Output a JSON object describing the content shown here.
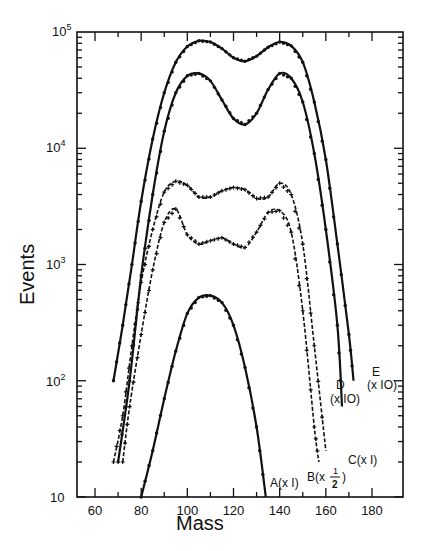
{
  "chart_data": {
    "type": "line",
    "title": "",
    "xlabel": "Mass",
    "ylabel": "Events",
    "xlim": [
      48,
      188
    ],
    "ylim": [
      10,
      100000
    ],
    "yscale": "log",
    "grid": false,
    "legend": "none (inline curve labels)",
    "x_ticks": [
      60,
      80,
      100,
      120,
      140,
      160,
      180
    ],
    "x_tick_labels": [
      "60",
      "80",
      "100",
      "120",
      "140",
      "160",
      "180"
    ],
    "y_ticks": [
      10,
      100,
      1000,
      10000,
      100000
    ],
    "y_tick_labels": [
      "10",
      "10^2",
      "10^3",
      "10^4",
      "10^5"
    ],
    "series": [
      {
        "name": "A(x1)",
        "label": "A(x I)",
        "style": "solid fit + points",
        "x": [
          80,
          85,
          90,
          95,
          100,
          105,
          110,
          115,
          120,
          125,
          130,
          134
        ],
        "values": [
          10,
          25,
          70,
          180,
          380,
          520,
          540,
          470,
          300,
          130,
          40,
          10
        ]
      },
      {
        "name": "B(x1/2)",
        "label": "B(x 1/2)",
        "style": "dashed + points",
        "x": [
          72,
          75,
          80,
          85,
          90,
          95,
          100,
          105,
          110,
          115,
          120,
          125,
          130,
          135,
          140,
          145,
          150,
          155,
          157
        ],
        "values": [
          20,
          60,
          250,
          900,
          2300,
          3000,
          1800,
          1500,
          1600,
          1700,
          1500,
          1400,
          1900,
          2800,
          2900,
          1900,
          400,
          40,
          20
        ]
      },
      {
        "name": "C(x1)",
        "label": "C(x I)",
        "style": "dashed + points",
        "x": [
          68,
          72,
          76,
          80,
          85,
          90,
          95,
          100,
          105,
          110,
          115,
          120,
          125,
          130,
          135,
          140,
          145,
          150,
          155,
          160
        ],
        "values": [
          20,
          50,
          200,
          700,
          2000,
          4200,
          5200,
          4800,
          3800,
          3800,
          4300,
          4600,
          4400,
          3700,
          3800,
          5000,
          4000,
          1500,
          200,
          25
        ]
      },
      {
        "name": "D(x10)",
        "label": "D (x IO)",
        "style": "solid fit + points",
        "x": [
          70,
          75,
          80,
          85,
          90,
          95,
          100,
          105,
          110,
          115,
          120,
          125,
          130,
          135,
          140,
          145,
          150,
          155,
          160,
          165,
          167
        ],
        "values": [
          20,
          100,
          800,
          4000,
          14000,
          30000,
          42000,
          44000,
          38000,
          26000,
          18000,
          16000,
          20000,
          32000,
          44000,
          40000,
          25000,
          9000,
          2000,
          300,
          60
        ]
      },
      {
        "name": "E(x10)",
        "label": "E (x IO)",
        "style": "solid fit + points",
        "x": [
          68,
          72,
          76,
          80,
          85,
          90,
          95,
          100,
          105,
          110,
          115,
          120,
          125,
          130,
          135,
          140,
          145,
          150,
          155,
          160,
          165,
          170,
          172
        ],
        "values": [
          100,
          300,
          1000,
          3500,
          12000,
          30000,
          55000,
          75000,
          84000,
          82000,
          72000,
          60000,
          56000,
          62000,
          74000,
          82000,
          76000,
          55000,
          25000,
          8000,
          1500,
          250,
          100
        ]
      }
    ],
    "annotations": [
      "A(x I)",
      "B(x 1/2)",
      "C(x I)",
      "D (x IO)",
      "E (x IO)"
    ]
  },
  "labels": {
    "xlabel": "Mass",
    "ylabel": "Events",
    "x_ticks": [
      "60",
      "80",
      "100",
      "120",
      "140",
      "160",
      "180"
    ],
    "y_base": "10",
    "y_exp": [
      "",
      "2",
      "3",
      "4",
      "5"
    ],
    "curve_A": "A(x I)",
    "curve_B_prefix": "B(x",
    "curve_B_num": "1",
    "curve_B_den": "2",
    "curve_B_suffix": ")",
    "curve_C": "C(x I)",
    "curve_D1": "D",
    "curve_D2": "(x IO)",
    "curve_E1": "E",
    "curve_E2": "(x IO)"
  }
}
